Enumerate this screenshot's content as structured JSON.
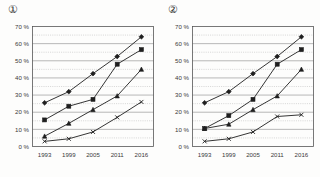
{
  "page": {
    "background_color": "#fdfdfc",
    "ink_color": "#1f1f1f"
  },
  "panels": [
    {
      "label": "①",
      "label_name": "panel-label-1",
      "chart_data": {
        "type": "line",
        "title": "",
        "xlabel": "",
        "ylabel": "",
        "categories": [
          "1993",
          "1999",
          "2005",
          "2011",
          "2016"
        ],
        "x": [
          1993,
          1999,
          2005,
          2011,
          2016
        ],
        "ylim": [
          0,
          70
        ],
        "yticks": [
          0,
          10,
          20,
          30,
          40,
          50,
          60,
          70
        ],
        "ytick_labels": [
          "0 %",
          "10 %",
          "20 %",
          "30 %",
          "40 %",
          "50 %",
          "60 %",
          "70 %"
        ],
        "minor_ytick_step": 5,
        "grid": "major solid, minor dotted",
        "legend": "none",
        "series": [
          {
            "name": "series-diamond",
            "marker": "diamond",
            "values": [
              25.5,
              32.0,
              42.5,
              52.5,
              64.0
            ]
          },
          {
            "name": "series-square",
            "marker": "square",
            "values": [
              15.5,
              23.5,
              27.5,
              48.0,
              56.5
            ]
          },
          {
            "name": "series-triangle",
            "marker": "triangle",
            "values": [
              6.0,
              13.5,
              21.5,
              29.5,
              45.0
            ]
          },
          {
            "name": "series-cross",
            "marker": "x",
            "values": [
              3.0,
              4.5,
              8.5,
              17.0,
              26.0
            ]
          }
        ]
      }
    },
    {
      "label": "②",
      "label_name": "panel-label-2",
      "chart_data": {
        "type": "line",
        "title": "",
        "xlabel": "",
        "ylabel": "",
        "categories": [
          "1993",
          "1999",
          "2005",
          "2011",
          "2016"
        ],
        "x": [
          1993,
          1999,
          2005,
          2011,
          2016
        ],
        "ylim": [
          0,
          70
        ],
        "yticks": [
          0,
          10,
          20,
          30,
          40,
          50,
          60,
          70
        ],
        "ytick_labels": [
          "0 %",
          "10 %",
          "20 %",
          "30 %",
          "40 %",
          "50 %",
          "60 %",
          "70 %"
        ],
        "minor_ytick_step": 5,
        "grid": "major solid, minor dotted",
        "legend": "none",
        "series": [
          {
            "name": "series-diamond",
            "marker": "diamond",
            "values": [
              25.5,
              32.0,
              42.5,
              52.5,
              64.0
            ]
          },
          {
            "name": "series-square",
            "marker": "square",
            "values": [
              10.5,
              18.0,
              27.5,
              48.0,
              56.5
            ]
          },
          {
            "name": "series-triangle",
            "marker": "triangle",
            "values": [
              10.5,
              13.0,
              21.5,
              29.5,
              45.0
            ]
          },
          {
            "name": "series-cross",
            "marker": "x",
            "values": [
              3.0,
              4.5,
              8.5,
              17.5,
              18.5
            ]
          }
        ]
      }
    }
  ]
}
